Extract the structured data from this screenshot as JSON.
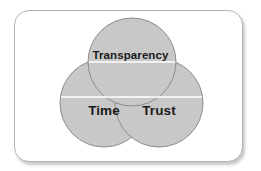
{
  "diagram": {
    "type": "venn",
    "title": "",
    "frame": {
      "shape": "rounded-rectangle",
      "border_color": "#b4b4b4",
      "background_color": "#ffffff",
      "has_drop_shadow": true
    },
    "circle_fill_color": "#c8c8c8",
    "circle_stroke_color": "#8c8c8c",
    "label_color": "#1a1a1a",
    "circles": [
      {
        "id": "transparency",
        "label": "Transparency",
        "position": "top",
        "cx": 132,
        "cy": 62,
        "r": 44
      },
      {
        "id": "time",
        "label": "Time",
        "position": "bottom-left",
        "cx": 104,
        "cy": 103,
        "r": 44
      },
      {
        "id": "trust",
        "label": "Trust",
        "position": "bottom-right",
        "cx": 159,
        "cy": 103,
        "r": 44
      }
    ]
  }
}
